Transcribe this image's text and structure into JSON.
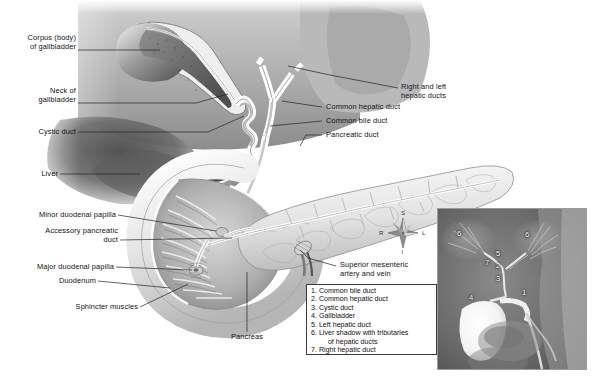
{
  "figure": {
    "background_color": "#ffffff"
  },
  "labels": {
    "corpus_of_gallbladder": "Corpus (body)\nof gallbladder",
    "neck_of_gallbladder": "Neck of\ngallbladder",
    "cystic_duct": "Cystic duct",
    "liver": "Liver",
    "minor_duodenal_papilla": "Minor duodenal papilla",
    "accessory_pancreatic_duct": "Accessory pancreatic\nduct",
    "major_duodenal_papilla": "Major duodenal papilla",
    "duodenum": "Duodenum",
    "sphincter_muscles": "Sphincter muscles",
    "pancreas": "Pancreas",
    "right_and_left_hepatic_ducts": "Right and left\nhepatic ducts",
    "common_hepatic_duct": "Common hepatic duct",
    "common_bile_duct": "Common bile duct",
    "pancreatic_duct": "Pancreatic duct",
    "superior_mesenteric": "Superior mesenteric\nartery and vein"
  },
  "legend": {
    "items": [
      "1. Common bile duct",
      "2. Common hepatic duct",
      "3. Cystic duct",
      "4. Gallbladder",
      "5. Left hepatic duct",
      "6. Liver shadow with tributaries\n    of hepatic ducts",
      "7. Right hepatic duct"
    ]
  },
  "compass": {
    "superior": "S",
    "inferior": "I",
    "right": "R",
    "left": "L"
  },
  "radiograph": {
    "markers": [
      {
        "id": "6",
        "x": 23,
        "y": 26
      },
      {
        "id": "6",
        "x": 91,
        "y": 27
      },
      {
        "id": "5",
        "x": 61,
        "y": 46
      },
      {
        "id": "7",
        "x": 50,
        "y": 55
      },
      {
        "id": "2",
        "x": 61,
        "y": 58
      },
      {
        "id": "3",
        "x": 61,
        "y": 71
      },
      {
        "id": "4",
        "x": 34,
        "y": 90
      },
      {
        "id": "1",
        "x": 87,
        "y": 85
      }
    ]
  }
}
